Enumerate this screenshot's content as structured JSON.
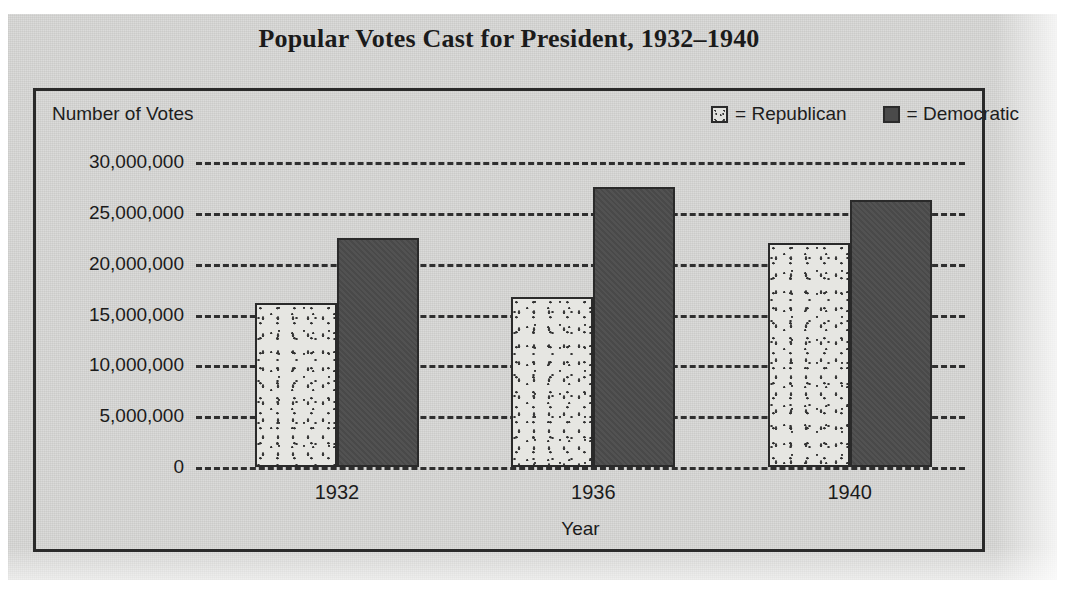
{
  "chart_data": {
    "type": "bar",
    "title": "Popular Votes Cast for President, 1932–1940",
    "xlabel": "Year",
    "ylabel": "Number of Votes",
    "categories": [
      "1932",
      "1936",
      "1940"
    ],
    "series": [
      {
        "name": "Republican",
        "values": [
          16100000,
          16700000,
          22000000
        ],
        "color": "#e6e6e2",
        "pattern": "stipple"
      },
      {
        "name": "Democratic",
        "values": [
          22500000,
          27500000,
          26300000
        ],
        "color": "#4c4c4c",
        "pattern": "solid"
      }
    ],
    "ylim": [
      0,
      30000000
    ],
    "ytick_values": [
      30000000,
      25000000,
      20000000,
      15000000,
      10000000,
      5000000,
      0
    ],
    "ytick_labels": [
      "30,000,000",
      "25,000,000",
      "20,000,000",
      "15,000,000",
      "10,000,000",
      "5,000,000",
      "0"
    ],
    "grid": "horizontal-dashed",
    "legend_position": "top-right"
  },
  "legend": {
    "items": [
      {
        "swatch": "republican-swatch",
        "label": "= Republican"
      },
      {
        "swatch": "democratic-swatch",
        "label": "= Democratic"
      }
    ]
  },
  "colors": {
    "paper": "#d9d9d7",
    "frame": "#2a2a2a",
    "republican": "#e6e6e2",
    "democratic": "#4c4c4c",
    "gridline": "#2f2f2f",
    "text": "#1b1b1b"
  }
}
